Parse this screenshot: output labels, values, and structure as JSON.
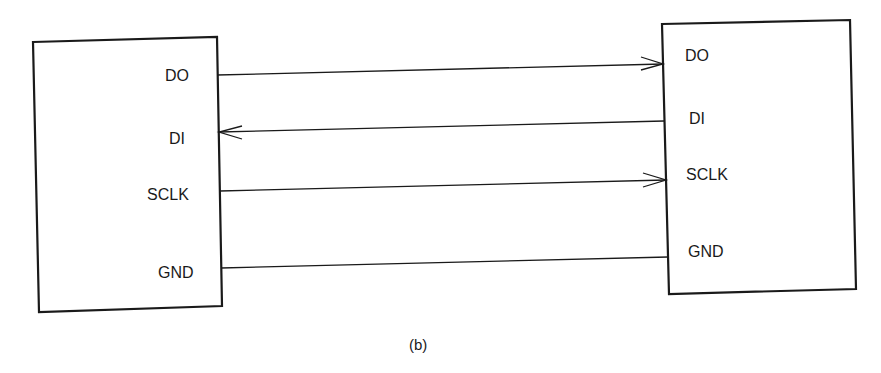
{
  "diagram": {
    "caption": "(b)",
    "left_device": {
      "pins": [
        {
          "label": "DO"
        },
        {
          "label": "DI"
        },
        {
          "label": "SCLK"
        },
        {
          "label": "GND"
        }
      ]
    },
    "right_device": {
      "pins": [
        {
          "label": "DO"
        },
        {
          "label": "DI"
        },
        {
          "label": "SCLK"
        },
        {
          "label": "GND"
        }
      ]
    },
    "connections": [
      {
        "from": "left.DO",
        "to": "right.DO",
        "arrow": "right"
      },
      {
        "from": "right.DI",
        "to": "left.DI",
        "arrow": "left"
      },
      {
        "from": "left.SCLK",
        "to": "right.SCLK",
        "arrow": "right"
      },
      {
        "from": "left.GND",
        "to": "right.GND",
        "arrow": "none"
      }
    ],
    "colors": {
      "line": "#1a1a1a",
      "background": "#ffffff"
    }
  }
}
